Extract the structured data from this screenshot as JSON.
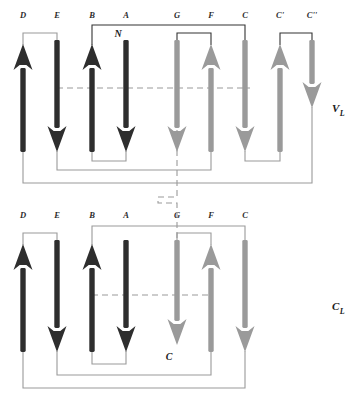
{
  "figure": {
    "background": "#ffffff",
    "colors": {
      "dark_strand": "#2e2e2e",
      "light_strand": "#9a9a9a",
      "dark_connector": "#333333",
      "light_connector": "#9a9a9a",
      "dashed_line": "#9a9a9a",
      "text": "#1a1a1a"
    }
  },
  "domains": [
    {
      "id": "VL",
      "label": "V",
      "subscript": "L",
      "label_x": 332,
      "label_y": 112,
      "top_labels_y": 18,
      "strands": [
        {
          "name": "D",
          "x": 23,
          "dir": "up",
          "shade": "dark",
          "top": 44,
          "bottom": 152
        },
        {
          "name": "E",
          "x": 57,
          "dir": "down",
          "shade": "dark",
          "top": 40,
          "bottom": 152
        },
        {
          "name": "B",
          "x": 92,
          "dir": "up",
          "shade": "dark",
          "top": 44,
          "bottom": 152
        },
        {
          "name": "A",
          "x": 126,
          "dir": "down",
          "shade": "dark",
          "top": 40,
          "bottom": 152
        },
        {
          "name": "G",
          "x": 177,
          "dir": "down",
          "shade": "light",
          "top": 40,
          "bottom": 152
        },
        {
          "name": "F",
          "x": 211,
          "dir": "up",
          "shade": "light",
          "top": 44,
          "bottom": 152
        },
        {
          "name": "C",
          "x": 245,
          "dir": "down",
          "shade": "light",
          "top": 40,
          "bottom": 152
        },
        {
          "name": "C'",
          "x": 280,
          "dir": "up",
          "shade": "light",
          "top": 44,
          "bottom": 152
        },
        {
          "name": "C''",
          "x": 312,
          "dir": "down",
          "shade": "light",
          "top": 40,
          "bottom": 108
        }
      ],
      "terminus": {
        "text": "N",
        "x": 126,
        "y": 37
      },
      "dashed_h": {
        "y": 88,
        "x1": 57,
        "x2": 250
      },
      "connectors": [
        {
          "from": "D",
          "to": "E",
          "side": "top",
          "y": 33,
          "shade": "light"
        },
        {
          "from": "B",
          "to": "C",
          "side": "top",
          "y": 25,
          "shade": "dark"
        },
        {
          "from": "G",
          "to": "F",
          "side": "top",
          "y": 33,
          "shade": "dark"
        },
        {
          "from": "C'",
          "to": "C''",
          "side": "top",
          "y": 33,
          "shade": "dark"
        },
        {
          "from": "B",
          "to": "A",
          "side": "bottom",
          "y": 161,
          "shade": "light"
        },
        {
          "from": "C",
          "to": "C'",
          "side": "bottom",
          "y": 161,
          "shade": "light"
        },
        {
          "from": "E",
          "to": "F",
          "side": "bottom",
          "y": 170,
          "shade": "light"
        },
        {
          "from": "D",
          "to": "C''",
          "side": "bottom",
          "y": 183,
          "shade": "light"
        }
      ]
    },
    {
      "id": "CL",
      "label": "C",
      "subscript": "L",
      "label_x": 332,
      "label_y": 310,
      "top_labels_y": 218,
      "strands": [
        {
          "name": "D",
          "x": 23,
          "dir": "up",
          "shade": "dark",
          "top": 244,
          "bottom": 352
        },
        {
          "name": "E",
          "x": 57,
          "dir": "down",
          "shade": "dark",
          "top": 240,
          "bottom": 352
        },
        {
          "name": "B",
          "x": 92,
          "dir": "up",
          "shade": "dark",
          "top": 244,
          "bottom": 352
        },
        {
          "name": "A",
          "x": 126,
          "dir": "down",
          "shade": "dark",
          "top": 240,
          "bottom": 352
        },
        {
          "name": "G",
          "x": 177,
          "dir": "down",
          "shade": "light",
          "top": 240,
          "bottom": 345
        },
        {
          "name": "F",
          "x": 211,
          "dir": "up",
          "shade": "light",
          "top": 244,
          "bottom": 352
        },
        {
          "name": "C",
          "x": 245,
          "dir": "down",
          "shade": "light",
          "top": 240,
          "bottom": 352
        }
      ],
      "terminus": {
        "text": "C",
        "x": 177,
        "y": 360
      },
      "dashed_h": {
        "y": 295,
        "x1": 92,
        "x2": 212
      },
      "connectors": [
        {
          "from": "D",
          "to": "E",
          "side": "top",
          "y": 233,
          "shade": "light"
        },
        {
          "from": "B",
          "to": "C",
          "side": "top",
          "y": 226,
          "shade": "light"
        },
        {
          "from": "G",
          "to": "F",
          "side": "top",
          "y": 233,
          "shade": "light"
        },
        {
          "from": "B",
          "to": "A",
          "side": "bottom",
          "y": 364,
          "shade": "light"
        },
        {
          "from": "E",
          "to": "F",
          "side": "bottom",
          "y": 375,
          "shade": "light"
        },
        {
          "from": "D",
          "to": "C",
          "side": "bottom",
          "y": 388,
          "shade": "light"
        }
      ]
    }
  ],
  "dashed_vertical": {
    "x": 177,
    "segments": [
      {
        "y1": 130,
        "y2": 197
      },
      {
        "y1": 197,
        "y2": 203
      },
      {
        "y1": 203,
        "y2": 250
      }
    ],
    "elbow": {
      "x1": 158,
      "y": 197,
      "x2": 177
    }
  }
}
